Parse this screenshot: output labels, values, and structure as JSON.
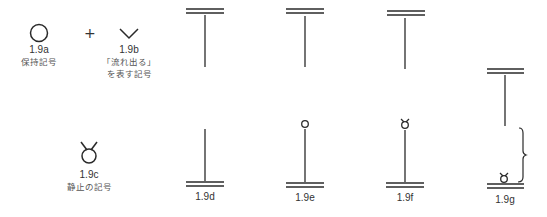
{
  "figures": {
    "a": {
      "label": "1.9a",
      "caption": "保持記号"
    },
    "plus": "+",
    "b": {
      "label": "1.9b",
      "caption_line1": "「流れ出る」",
      "caption_line2": "を表す記号"
    },
    "c": {
      "label": "1.9c",
      "caption": "静止の記号"
    },
    "d": {
      "label": "1.9d"
    },
    "e": {
      "label": "1.9e"
    },
    "f": {
      "label": "1.9f"
    },
    "g": {
      "label": "1.9g"
    }
  },
  "colors": {
    "stroke": "#333333",
    "text": "#333333"
  }
}
